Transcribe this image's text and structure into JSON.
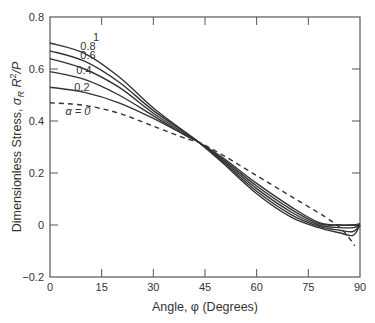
{
  "chart_data": {
    "type": "line",
    "title": "",
    "xlabel": "Angle, φ (Degrees)",
    "ylabel": "Dimensionless Stress, σR R²/P",
    "xlim": [
      0,
      90
    ],
    "ylim": [
      -0.2,
      0.8
    ],
    "xticks": [
      0,
      15,
      30,
      45,
      60,
      75,
      90
    ],
    "yticks": [
      -0.2,
      0,
      0.2,
      0.4,
      0.6,
      0.8
    ],
    "xtick_labels": [
      "0",
      "15",
      "30",
      "45",
      "60",
      "75",
      "90"
    ],
    "ytick_labels": [
      "−0.2",
      "0",
      "0.2",
      "0.4",
      "0.6",
      "0.8"
    ],
    "grid": false,
    "legend": "inline curve labels",
    "series": [
      {
        "name": "α = 1",
        "label": "1",
        "style": "solid",
        "x": [
          0,
          10,
          20,
          30,
          40,
          43,
          50,
          60,
          70,
          78,
          84,
          88,
          90
        ],
        "y": [
          0.7,
          0.66,
          0.57,
          0.45,
          0.35,
          0.32,
          0.24,
          0.12,
          0.03,
          -0.01,
          -0.03,
          -0.04,
          0.0
        ]
      },
      {
        "name": "α = 0.8",
        "label": "0.8",
        "style": "solid",
        "x": [
          0,
          10,
          20,
          30,
          40,
          43,
          50,
          60,
          70,
          78,
          84,
          88,
          90
        ],
        "y": [
          0.67,
          0.63,
          0.55,
          0.44,
          0.35,
          0.32,
          0.245,
          0.13,
          0.04,
          -0.005,
          -0.02,
          -0.025,
          0.0
        ]
      },
      {
        "name": "α = 0.6",
        "label": "0.6",
        "style": "solid",
        "x": [
          0,
          10,
          20,
          30,
          40,
          43,
          50,
          60,
          70,
          78,
          84,
          88,
          90
        ],
        "y": [
          0.64,
          0.6,
          0.53,
          0.43,
          0.345,
          0.32,
          0.25,
          0.14,
          0.05,
          0.0,
          -0.01,
          -0.01,
          0.0
        ]
      },
      {
        "name": "α = 0.4",
        "label": "0.4",
        "style": "solid",
        "x": [
          0,
          10,
          20,
          30,
          40,
          43,
          50,
          60,
          70,
          78,
          84,
          88,
          90
        ],
        "y": [
          0.59,
          0.56,
          0.5,
          0.42,
          0.34,
          0.32,
          0.255,
          0.15,
          0.06,
          0.005,
          0.0,
          0.0,
          0.0
        ]
      },
      {
        "name": "α = 0.2",
        "label": "0.2",
        "style": "solid",
        "x": [
          0,
          10,
          20,
          30,
          40,
          43,
          50,
          60,
          70,
          78,
          84,
          88,
          90
        ],
        "y": [
          0.53,
          0.51,
          0.47,
          0.41,
          0.34,
          0.32,
          0.26,
          0.16,
          0.07,
          0.01,
          0.0,
          0.0,
          0.005
        ]
      },
      {
        "name": "α = 0",
        "label": "α = 0",
        "style": "dashed",
        "x": [
          0,
          10,
          20,
          30,
          40,
          43,
          50,
          60,
          70,
          80,
          85,
          88.5
        ],
        "y": [
          0.47,
          0.46,
          0.43,
          0.38,
          0.33,
          0.32,
          0.27,
          0.19,
          0.11,
          0.03,
          -0.02,
          -0.08
        ]
      }
    ],
    "annotations": [
      "1",
      "0.8",
      "0.6",
      "0.4",
      "0.2",
      "α = 0"
    ]
  }
}
